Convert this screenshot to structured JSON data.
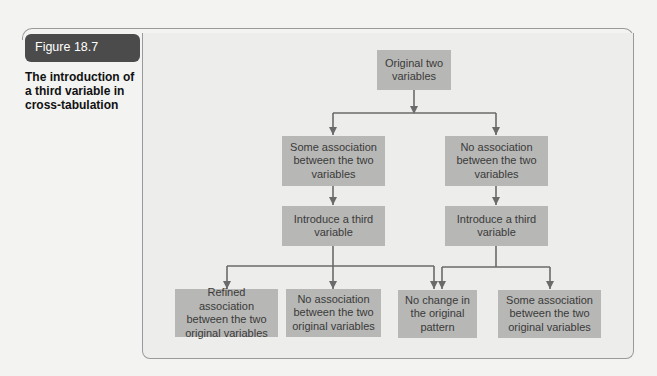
{
  "figure": {
    "label": "Figure 18.7",
    "caption": "The introduction of a third variable in cross-tabulation"
  },
  "diagram": {
    "nodes": {
      "root": "Original two variables",
      "some_assoc": "Some association between the two variables",
      "no_assoc": "No association between the two variables",
      "intro_left": "Introduce a third variable",
      "intro_right": "Introduce a third variable",
      "refined": "Refined association between the two original variables",
      "no_assoc_orig": "No association between the two original variables",
      "no_change": "No change in the original pattern",
      "some_assoc_orig": "Some association between the two original variables"
    },
    "colors": {
      "box_fill": "#b7b7b5",
      "box_text": "#3a3a3a",
      "arrow": "#6a6a6a",
      "label_bg": "#4b4b4b"
    }
  }
}
